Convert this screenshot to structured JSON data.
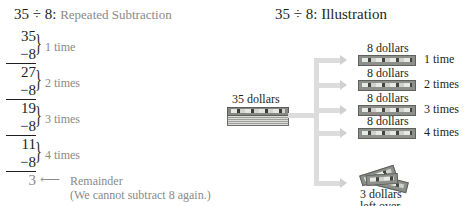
{
  "left": {
    "title_main": "35 ÷ 8:",
    "title_sub": "Repeated Subtraction",
    "steps": [
      {
        "minuend": "35",
        "subtrahend": "−8",
        "label": "1 time"
      },
      {
        "minuend": "27",
        "subtrahend": "−8",
        "label": "2 times"
      },
      {
        "minuend": "19",
        "subtrahend": "−8",
        "label": "3 times"
      },
      {
        "minuend": "11",
        "subtrahend": "−8",
        "label": "4 times"
      }
    ],
    "remainder": "3",
    "remainder_arrow": "⟵",
    "remainder_label": "Remainder",
    "remainder_note": "(We cannot subtract 8 again.)"
  },
  "right": {
    "title": "35 ÷ 8: Illustration",
    "source_label": "35 dollars",
    "branches": [
      {
        "amount": "8 dollars",
        "label": "1 time"
      },
      {
        "amount": "8 dollars",
        "label": "2 times"
      },
      {
        "amount": "8 dollars",
        "label": "3 times"
      },
      {
        "amount": "8 dollars",
        "label": "4 times"
      }
    ],
    "leftover_line1": "3 dollars",
    "leftover_line2": "left over"
  },
  "colors": {
    "text": "#231f20",
    "muted": "#8a8a8a",
    "arrow": "#dcdcdc"
  }
}
